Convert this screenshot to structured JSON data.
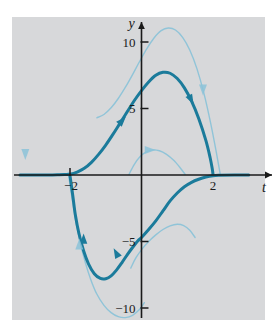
{
  "figure": {
    "title": "",
    "background_color": "#ffffff",
    "plot_background_color": "#d7d8da",
    "axis_color": "#1a1a1a",
    "curve_color_dark": "#1b7b9b",
    "curve_color_light": "#8cc3d8"
  },
  "axes": {
    "x_axis_label": "t",
    "y_axis_label": "y",
    "x_ticks": [
      {
        "value": -2,
        "label": "−2"
      },
      {
        "value": 2,
        "label": "2"
      }
    ],
    "y_ticks": [
      {
        "value": 10,
        "label": "10"
      },
      {
        "value": 5,
        "label": "5"
      },
      {
        "value": -5,
        "label": "−5"
      },
      {
        "value": -10,
        "label": "−10"
      }
    ],
    "xlim": [
      -3.4,
      3.0
    ],
    "ylim": [
      -12.2,
      11.6
    ]
  },
  "chart_data": {
    "type": "line",
    "title": "",
    "xlabel": "t",
    "ylabel": "y",
    "xlim": [
      -3.4,
      3.0
    ],
    "ylim": [
      -12.2,
      11.6
    ],
    "grid": false,
    "legend": "none",
    "series": [
      {
        "name": "emphasized-solution",
        "emphasis": "dark",
        "color": "#1b7b9b",
        "width": 3.0,
        "points": [
          [
            -3.4,
            0.0
          ],
          [
            -3.0,
            0.0
          ],
          [
            -2.6,
            0.0
          ],
          [
            -2.3,
            0.02
          ],
          [
            -2.1,
            0.04
          ],
          [
            -2.0,
            0.05
          ],
          [
            -1.8,
            0.22
          ],
          [
            -1.6,
            0.5
          ],
          [
            -1.4,
            0.95
          ],
          [
            -1.2,
            1.55
          ],
          [
            -1.0,
            2.25
          ],
          [
            -0.8,
            3.05
          ],
          [
            -0.6,
            3.9
          ],
          [
            -0.4,
            4.75
          ],
          [
            -0.2,
            5.6
          ],
          [
            0.0,
            6.35
          ],
          [
            0.2,
            7.0
          ],
          [
            0.4,
            7.5
          ],
          [
            0.6,
            7.72
          ],
          [
            0.8,
            7.65
          ],
          [
            1.0,
            7.25
          ],
          [
            1.2,
            6.55
          ],
          [
            1.4,
            5.55
          ],
          [
            1.6,
            4.25
          ],
          [
            1.8,
            2.6
          ],
          [
            1.92,
            1.3
          ],
          [
            1.98,
            0.45
          ],
          [
            2.0,
            0.05
          ]
        ]
      },
      {
        "name": "emphasized-solution-lower",
        "emphasis": "dark",
        "color": "#1b7b9b",
        "width": 3.0,
        "points": [
          [
            -2.0,
            -0.05
          ],
          [
            -1.92,
            -1.6
          ],
          [
            -1.85,
            -3.0
          ],
          [
            -1.75,
            -4.4
          ],
          [
            -1.62,
            -5.7
          ],
          [
            -1.48,
            -6.7
          ],
          [
            -1.32,
            -7.42
          ],
          [
            -1.15,
            -7.78
          ],
          [
            -1.0,
            -7.8
          ],
          [
            -0.85,
            -7.58
          ],
          [
            -0.7,
            -7.15
          ],
          [
            -0.55,
            -6.6
          ],
          [
            -0.4,
            -6.0
          ],
          [
            -0.25,
            -5.45
          ],
          [
            -0.1,
            -4.95
          ],
          [
            0.0,
            -4.7
          ],
          [
            0.2,
            -4.1
          ],
          [
            0.4,
            -3.45
          ],
          [
            0.6,
            -2.7
          ],
          [
            0.8,
            -1.95
          ],
          [
            1.0,
            -1.35
          ],
          [
            1.2,
            -0.88
          ],
          [
            1.4,
            -0.55
          ],
          [
            1.6,
            -0.32
          ],
          [
            1.8,
            -0.15
          ],
          [
            2.0,
            -0.05
          ],
          [
            2.2,
            -0.02
          ],
          [
            2.6,
            0.0
          ],
          [
            3.0,
            0.0
          ]
        ]
      },
      {
        "name": "outer-upper-solution",
        "emphasis": "light",
        "color": "#8cc3d8",
        "width": 1.4,
        "points": [
          [
            -1.25,
            4.3
          ],
          [
            -1.05,
            4.55
          ],
          [
            -0.85,
            5.05
          ],
          [
            -0.65,
            5.75
          ],
          [
            -0.45,
            6.6
          ],
          [
            -0.25,
            7.55
          ],
          [
            -0.05,
            8.55
          ],
          [
            0.15,
            9.5
          ],
          [
            0.35,
            10.3
          ],
          [
            0.55,
            10.85
          ],
          [
            0.75,
            11.05
          ],
          [
            0.95,
            10.9
          ],
          [
            1.15,
            10.35
          ],
          [
            1.35,
            9.4
          ],
          [
            1.55,
            8.0
          ],
          [
            1.75,
            6.1
          ],
          [
            1.95,
            3.7
          ],
          [
            2.1,
            1.6
          ],
          [
            2.2,
            0.1
          ]
        ]
      },
      {
        "name": "inner-upper-small-arc",
        "emphasis": "light",
        "color": "#8cc3d8",
        "width": 1.4,
        "points": [
          [
            -0.35,
            0.05
          ],
          [
            -0.2,
            0.8
          ],
          [
            -0.05,
            1.35
          ],
          [
            0.12,
            1.72
          ],
          [
            0.3,
            1.88
          ],
          [
            0.5,
            1.82
          ],
          [
            0.7,
            1.55
          ],
          [
            0.9,
            1.1
          ],
          [
            1.08,
            0.55
          ],
          [
            1.22,
            0.05
          ]
        ]
      },
      {
        "name": "inner-lower-small-arc",
        "emphasis": "light",
        "color": "#8cc3d8",
        "width": 1.4,
        "points": [
          [
            -0.3,
            -7.0
          ],
          [
            -0.15,
            -6.2
          ],
          [
            0.02,
            -5.55
          ],
          [
            0.2,
            -5.0
          ],
          [
            0.4,
            -4.5
          ],
          [
            0.6,
            -4.1
          ],
          [
            0.8,
            -3.82
          ],
          [
            1.0,
            -3.7
          ],
          [
            1.18,
            -3.8
          ],
          [
            1.35,
            -4.15
          ],
          [
            1.5,
            -4.7
          ]
        ]
      },
      {
        "name": "outer-lower-solution",
        "emphasis": "light",
        "color": "#8cc3d8",
        "width": 1.4,
        "points": [
          [
            -2.05,
            0.2
          ],
          [
            -1.95,
            -1.6
          ],
          [
            -1.85,
            -3.3
          ],
          [
            -1.72,
            -5.0
          ],
          [
            -1.58,
            -6.5
          ],
          [
            -1.42,
            -7.85
          ],
          [
            -1.25,
            -8.95
          ],
          [
            -1.05,
            -9.8
          ],
          [
            -0.85,
            -10.35
          ],
          [
            -0.65,
            -10.65
          ],
          [
            -0.45,
            -10.72
          ],
          [
            -0.25,
            -10.55
          ],
          [
            -0.05,
            -10.1
          ],
          [
            0.08,
            -9.6
          ]
        ]
      },
      {
        "name": "left-tail-light",
        "emphasis": "light",
        "color": "#8cc3d8",
        "width": 1.4,
        "points": [
          [
            -3.25,
            0.02
          ],
          [
            -2.8,
            0.02
          ],
          [
            -2.4,
            0.03
          ],
          [
            -2.1,
            0.05
          ]
        ]
      }
    ],
    "arrows": [
      {
        "name": "arrow-left-down",
        "x": -3.25,
        "y": 1.6,
        "direction": "down",
        "style": "light"
      },
      {
        "name": "arrow-rising-dark",
        "x": -0.55,
        "y": 4.05,
        "direction": "up-right",
        "style": "dark"
      },
      {
        "name": "arrow-descending-dark",
        "x": 1.38,
        "y": 5.7,
        "direction": "down-right",
        "style": "dark"
      },
      {
        "name": "arrow-descending-light",
        "x": 1.72,
        "y": 6.45,
        "direction": "down",
        "style": "light"
      },
      {
        "name": "arrow-small-arc-right",
        "x": 0.22,
        "y": 1.88,
        "direction": "right",
        "style": "light"
      },
      {
        "name": "arrow-lower-dark-up",
        "x": -0.7,
        "y": -5.9,
        "direction": "up-left",
        "style": "dark"
      },
      {
        "name": "arrow-lower-left-dark",
        "x": -1.62,
        "y": -4.85,
        "direction": "up",
        "style": "dark"
      },
      {
        "name": "arrow-lower-left-light",
        "x": -1.74,
        "y": -5.25,
        "direction": "up",
        "style": "light"
      }
    ]
  }
}
